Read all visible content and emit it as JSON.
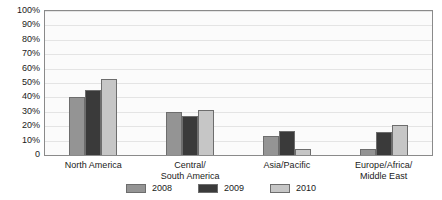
{
  "chart_data": {
    "type": "bar",
    "title": "",
    "xlabel": "",
    "ylabel": "",
    "ylim": [
      0,
      100
    ],
    "y_unit": "%",
    "grid": true,
    "legend_position": "bottom",
    "categories": [
      "North America",
      "Central/\nSouth America",
      "Asia/Pacific",
      "Europe/Africa/\nMiddle East"
    ],
    "y_ticks": [
      "0",
      "10%",
      "20%",
      "30%",
      "40%",
      "50%",
      "60%",
      "70%",
      "80%",
      "90%",
      "100%"
    ],
    "y_tick_values": [
      0,
      10,
      20,
      30,
      40,
      50,
      60,
      70,
      80,
      90,
      100
    ],
    "series": [
      {
        "name": "2008",
        "color": "#949494",
        "values": [
          40,
          30,
          13,
          4
        ]
      },
      {
        "name": "2009",
        "color": "#3a3a3a",
        "values": [
          45,
          27,
          17,
          16
        ]
      },
      {
        "name": "2010",
        "color": "#c6c6c6",
        "values": [
          53,
          31,
          4,
          21
        ]
      }
    ]
  }
}
